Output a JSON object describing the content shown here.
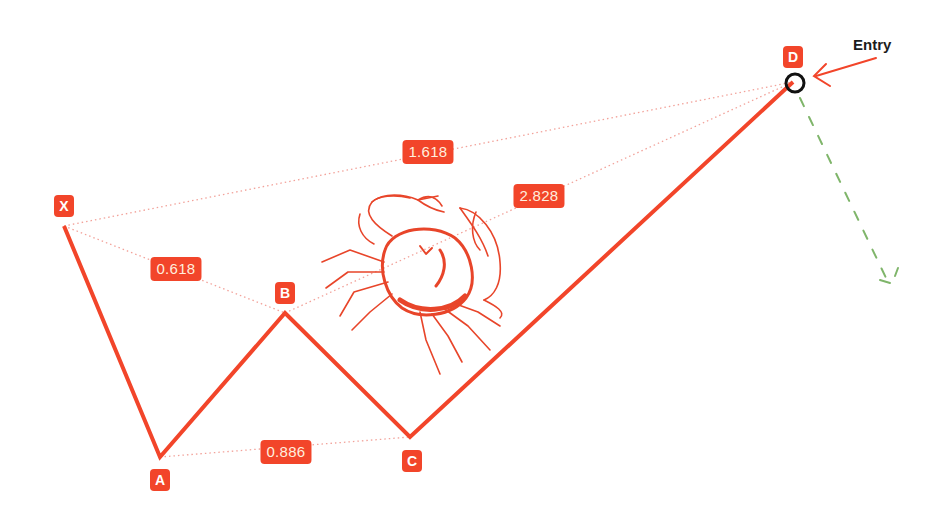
{
  "pattern": {
    "name": "Crab harmonic pattern",
    "color": "#f2452a",
    "points": {
      "X": {
        "label": "X",
        "x": 64,
        "y": 226
      },
      "A": {
        "label": "A",
        "x": 160,
        "y": 457
      },
      "B": {
        "label": "B",
        "x": 285,
        "y": 313
      },
      "C": {
        "label": "C",
        "x": 410,
        "y": 437
      },
      "D": {
        "label": "D",
        "x": 793,
        "y": 82
      }
    },
    "ratios": [
      {
        "id": "xb",
        "value": "0.618",
        "x": 176,
        "y": 269
      },
      {
        "id": "ac",
        "value": "0.886",
        "x": 286,
        "y": 452
      },
      {
        "id": "xd",
        "value": "1.618",
        "x": 428,
        "y": 152
      },
      {
        "id": "bd",
        "value": "2.828",
        "x": 539,
        "y": 196
      }
    ]
  },
  "entry": {
    "label": "Entry",
    "marker_color": "#111111",
    "arrow_color": "#f2452a"
  },
  "projection": {
    "color": "#7fb56a",
    "style": "dashed"
  },
  "icon": "crab-illustration"
}
